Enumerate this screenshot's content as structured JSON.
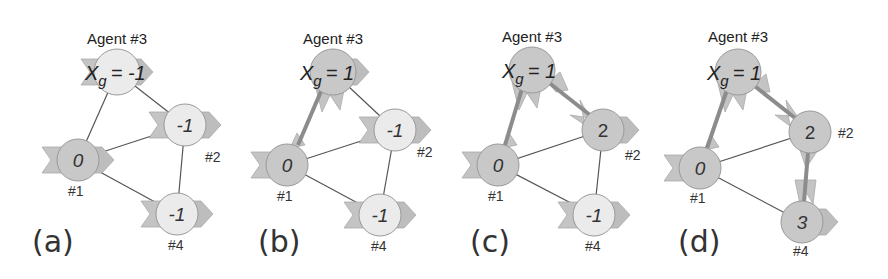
{
  "figure": {
    "colors": {
      "node_active": "#c8c8c8",
      "node_inactive": "#ebebeb",
      "node_stroke": "#9a9a9a",
      "arrow_fill": "#bdbdbd",
      "edge": "#555555",
      "active_edge": "#8c8c8c"
    },
    "panels": [
      {
        "label": "(a)",
        "agent_title": "Agent #3",
        "goal_text": "= -1",
        "goal_symbol": "X",
        "goal_sub": "g",
        "nodes": [
          {
            "id": "#1",
            "value": "0",
            "active": true
          },
          {
            "id": "#2",
            "value": "-1",
            "active": false
          },
          {
            "id": "#3",
            "value": "X_g = -1",
            "active": false
          },
          {
            "id": "#4",
            "value": "-1",
            "active": false
          }
        ],
        "edges": [
          [
            "#3",
            "#1"
          ],
          [
            "#3",
            "#2"
          ],
          [
            "#1",
            "#2"
          ],
          [
            "#1",
            "#4"
          ],
          [
            "#2",
            "#4"
          ]
        ],
        "active_edges": []
      },
      {
        "label": "(b)",
        "agent_title": "Agent #3",
        "goal_text": "= 1",
        "goal_symbol": "X",
        "goal_sub": "g",
        "nodes": [
          {
            "id": "#1",
            "value": "0",
            "active": true
          },
          {
            "id": "#2",
            "value": "-1",
            "active": false
          },
          {
            "id": "#3",
            "value": "X_g = 1",
            "active": true
          },
          {
            "id": "#4",
            "value": "-1",
            "active": false
          }
        ],
        "edges": [
          [
            "#3",
            "#1"
          ],
          [
            "#3",
            "#2"
          ],
          [
            "#1",
            "#2"
          ],
          [
            "#1",
            "#4"
          ],
          [
            "#2",
            "#4"
          ]
        ],
        "active_edges": [
          [
            "#1",
            "#3"
          ]
        ]
      },
      {
        "label": "(c)",
        "agent_title": "Agent #3",
        "goal_text": "= 1",
        "goal_symbol": "X",
        "goal_sub": "g",
        "nodes": [
          {
            "id": "#1",
            "value": "0",
            "active": true
          },
          {
            "id": "#2",
            "value": "2",
            "active": true
          },
          {
            "id": "#3",
            "value": "X_g = 1",
            "active": true
          },
          {
            "id": "#4",
            "value": "-1",
            "active": false
          }
        ],
        "edges": [
          [
            "#3",
            "#1"
          ],
          [
            "#3",
            "#2"
          ],
          [
            "#1",
            "#2"
          ],
          [
            "#1",
            "#4"
          ],
          [
            "#2",
            "#4"
          ]
        ],
        "active_edges": [
          [
            "#1",
            "#3"
          ],
          [
            "#3",
            "#2"
          ]
        ]
      },
      {
        "label": "(d)",
        "agent_title": "Agent #3",
        "goal_text": "= 1",
        "goal_symbol": "X",
        "goal_sub": "g",
        "nodes": [
          {
            "id": "#1",
            "value": "0",
            "active": true
          },
          {
            "id": "#2",
            "value": "2",
            "active": true
          },
          {
            "id": "#3",
            "value": "X_g = 1",
            "active": true
          },
          {
            "id": "#4",
            "value": "3",
            "active": true
          }
        ],
        "edges": [
          [
            "#3",
            "#1"
          ],
          [
            "#3",
            "#2"
          ],
          [
            "#1",
            "#2"
          ],
          [
            "#1",
            "#4"
          ],
          [
            "#2",
            "#4"
          ]
        ],
        "active_edges": [
          [
            "#1",
            "#3"
          ],
          [
            "#3",
            "#2"
          ],
          [
            "#2",
            "#4"
          ]
        ]
      }
    ]
  }
}
